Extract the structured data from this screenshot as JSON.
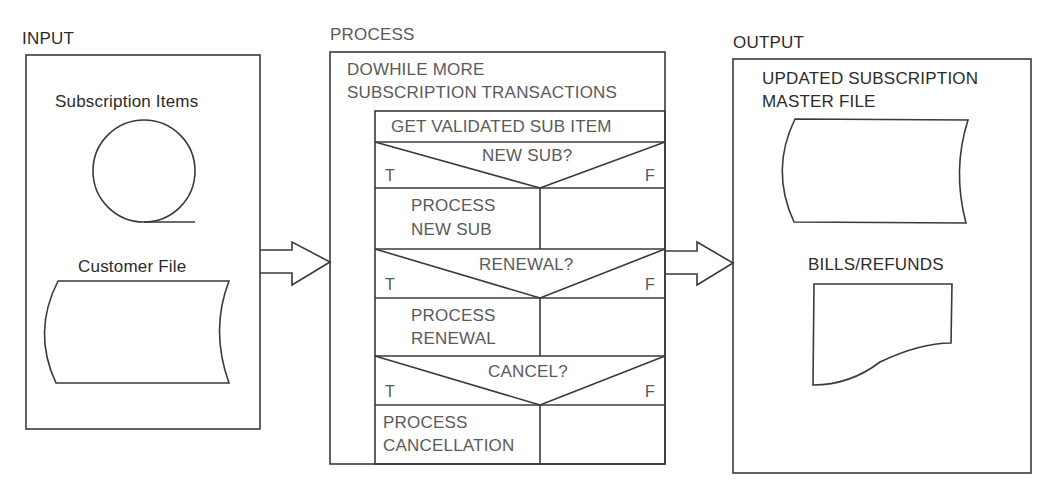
{
  "diagram": {
    "type": "IPO chart with Nassi-Shneiderman process",
    "input": {
      "title": "INPUT",
      "items": [
        {
          "label": "Subscription Items",
          "symbol": "magnetic-tape"
        },
        {
          "label": "Customer File",
          "symbol": "stored-data"
        }
      ]
    },
    "process": {
      "title": "PROCESS",
      "loop_label_line1": "DOWHILE MORE",
      "loop_label_line2": "SUBSCRIPTION TRANSACTIONS",
      "first_step": "GET VALIDATED SUB ITEM",
      "decisions": [
        {
          "condition": "NEW SUB?",
          "true_label": "T",
          "false_label": "F",
          "true_action_line1": "PROCESS",
          "true_action_line2": "NEW SUB"
        },
        {
          "condition": "RENEWAL?",
          "true_label": "T",
          "false_label": "F",
          "true_action_line1": "PROCESS",
          "true_action_line2": "RENEWAL"
        },
        {
          "condition": "CANCEL?",
          "true_label": "T",
          "false_label": "F",
          "true_action_line1": "PROCESS",
          "true_action_line2": "CANCELLATION"
        }
      ]
    },
    "output": {
      "title": "OUTPUT",
      "items": [
        {
          "label_line1": "UPDATED SUBSCRIPTION",
          "label_line2": "MASTER FILE",
          "symbol": "stored-data"
        },
        {
          "label": "BILLS/REFUNDS",
          "symbol": "document"
        }
      ]
    }
  }
}
